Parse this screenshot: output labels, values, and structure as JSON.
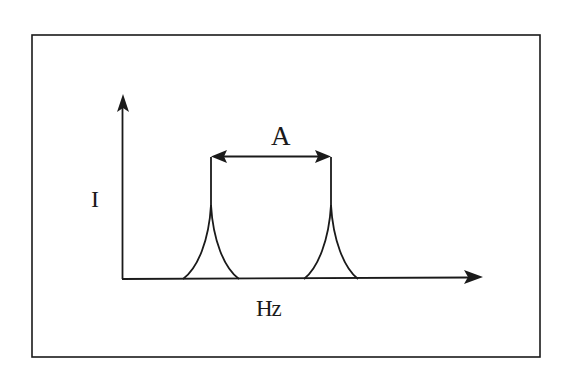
{
  "diagram": {
    "title": "",
    "labels": {
      "separation": "A",
      "y_axis": "I",
      "x_axis": "Hz"
    },
    "colors": {
      "stroke": "#1a1a1a",
      "background": "#ffffff"
    },
    "frame": {
      "x1": 32,
      "y1": 35,
      "x2": 540,
      "y2": 357
    },
    "axes": {
      "origin": [
        122,
        279
      ],
      "y_tip": [
        123,
        96
      ],
      "x_tip": [
        482,
        277
      ]
    },
    "peaks": [
      {
        "name": "left-peak",
        "center_x": 211,
        "top_y": 156,
        "base_left_x": 183,
        "base_right_x": 239
      },
      {
        "name": "right-peak",
        "center_x": 331,
        "top_y": 156,
        "base_left_x": 304,
        "base_right_x": 358
      }
    ],
    "separation_arrow": {
      "y": 156,
      "x1": 211,
      "x2": 331
    }
  }
}
